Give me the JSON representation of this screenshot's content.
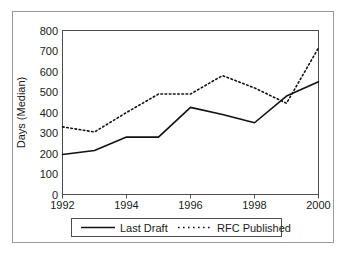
{
  "chart_data": {
    "type": "line",
    "title": "",
    "xlabel": "",
    "ylabel": "Days (Median)",
    "x": [
      1992,
      1993,
      1994,
      1995,
      1996,
      1997,
      1998,
      1999,
      2000
    ],
    "xlim": [
      1992,
      2000
    ],
    "ylim": [
      0,
      800
    ],
    "xticks": [
      1992,
      1994,
      1996,
      1998,
      2000
    ],
    "xtick_labels": [
      "1992",
      "1994",
      "1996",
      "1998",
      "2000"
    ],
    "yticks": [
      0,
      100,
      200,
      300,
      400,
      500,
      600,
      700,
      800
    ],
    "ytick_labels": [
      "0",
      "100",
      "200",
      "300",
      "400",
      "500",
      "600",
      "700",
      "800"
    ],
    "grid": false,
    "legend_position": "below-axes",
    "series": [
      {
        "name": "Last Draft",
        "style": "solid",
        "color": "#111111",
        "values": [
          195,
          215,
          280,
          280,
          425,
          390,
          350,
          480,
          550
        ]
      },
      {
        "name": "RFC Published",
        "style": "dotted",
        "color": "#111111",
        "values": [
          330,
          305,
          400,
          490,
          490,
          580,
          520,
          445,
          715
        ]
      }
    ]
  },
  "legend": {
    "entries": [
      {
        "label": "Last Draft"
      },
      {
        "label": "RFC Published"
      }
    ]
  }
}
